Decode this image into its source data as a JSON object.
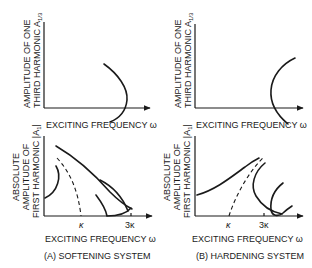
{
  "figure": {
    "panels": [
      {
        "id": "A-top",
        "system": "softening",
        "y_label_line1": "AMPLITUDE OF ONE",
        "y_label_line2": "THIRD HARMONIC A",
        "y_label_sub": "1/3",
        "x_label": "EXCITING FREQUENCY ω"
      },
      {
        "id": "B-top",
        "system": "hardening",
        "y_label_line1": "AMPLITUDE OF ONE",
        "y_label_line2": "THIRD HARMONIC A",
        "y_label_sub": "1/3",
        "x_label": "EXCITING FREQUENCY ω"
      },
      {
        "id": "A-bottom",
        "system": "softening",
        "y_label_line1": "ABSOLUTE",
        "y_label_line2": "AMPLITUDE OF",
        "y_label_line3": "FIRST HARMONIC |A",
        "y_label_sub": "1",
        "y_label_close": "|",
        "x_label": "EXCITING FREQUENCY ω",
        "ticks": [
          "κ",
          "3κ"
        ],
        "caption": "(A) SOFTENING SYSTEM"
      },
      {
        "id": "B-bottom",
        "system": "hardening",
        "y_label_line1": "ABSOLUTE",
        "y_label_line2": "AMPLITUDE OF",
        "y_label_line3": "FIRST HARMONIC |A",
        "y_label_sub": "1",
        "y_label_close": "|",
        "x_label": "EXCITING FREQUENCY ω",
        "ticks": [
          "κ",
          "3κ"
        ],
        "caption": "(B) HARDENING SYSTEM"
      }
    ],
    "colors": {
      "ink": "#1a1a1a",
      "background": "#ffffff"
    }
  }
}
